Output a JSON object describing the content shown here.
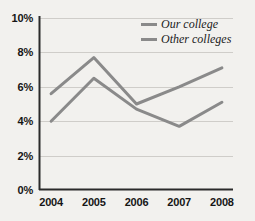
{
  "chart_data": {
    "type": "line",
    "title": "",
    "subtitle": "",
    "xlabel": "",
    "ylabel": "",
    "categories": [
      "2004",
      "2005",
      "2006",
      "2007",
      "2008"
    ],
    "ylim": [
      0,
      10
    ],
    "y_ticks": [
      0,
      2,
      4,
      6,
      8,
      10
    ],
    "y_tick_labels": [
      "0%",
      "2%",
      "4%",
      "6%",
      "8%",
      "10%"
    ],
    "grid": "horizontal",
    "legend_position": "top-right-inside",
    "value_suffix": "%",
    "series": [
      {
        "name": "Our college",
        "color": "#8a8a8a",
        "values": [
          5.6,
          7.7,
          5.0,
          6.0,
          7.1
        ]
      },
      {
        "name": "Other colleges",
        "color": "#8a8a8a",
        "values": [
          4.0,
          6.5,
          4.7,
          3.7,
          5.1
        ]
      }
    ]
  },
  "axis": {
    "line_color": "#2b2b2b",
    "grid_color": "#cfcdc9"
  },
  "background": {
    "color": "#f2f1ee"
  }
}
